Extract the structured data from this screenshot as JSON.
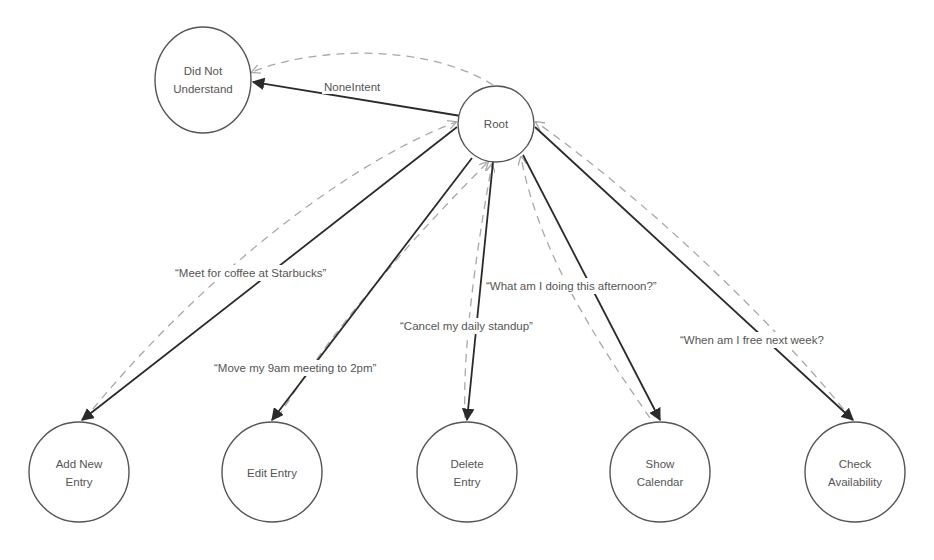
{
  "diagram": {
    "nodes": {
      "root": {
        "label": "Root"
      },
      "did_not_understand": {
        "line1": "Did Not",
        "line2": "Understand"
      },
      "add_new_entry": {
        "line1": "Add New",
        "line2": "Entry"
      },
      "edit_entry": {
        "label": "Edit Entry"
      },
      "delete_entry": {
        "line1": "Delete",
        "line2": "Entry"
      },
      "show_calendar": {
        "line1": "Show",
        "line2": "Calendar"
      },
      "check_availability": {
        "line1": "Check",
        "line2": "Availability"
      }
    },
    "edges": {
      "none_intent": "NoneIntent",
      "add_new_entry": "“Meet for coffee at Starbucks”",
      "edit_entry": "“Move my 9am meeting to 2pm”",
      "delete_entry": "“Cancel my daily standup”",
      "show_calendar": "“What am I doing this afternoon?”",
      "check_availability": "“When am I free next week?"
    },
    "colors": {
      "node_stroke": "#555555",
      "solid_edge": "#2a2a2a",
      "dashed_edge": "#a8a8a8",
      "text": "#555555"
    }
  }
}
